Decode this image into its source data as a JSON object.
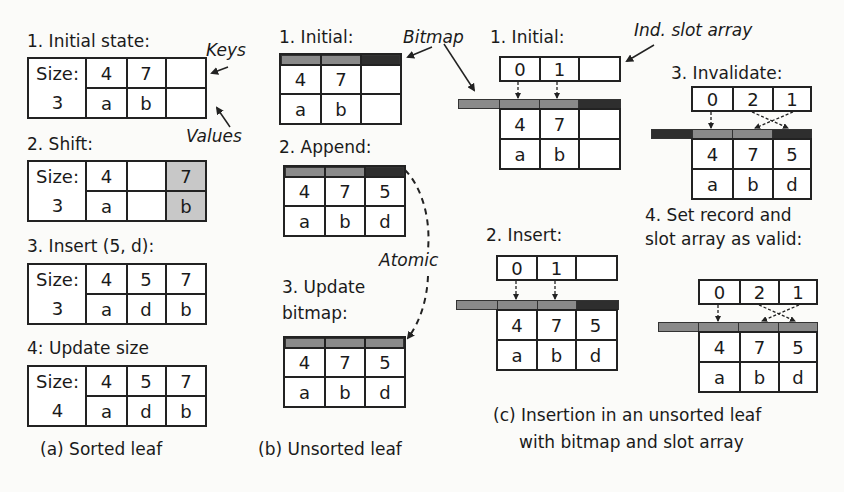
{
  "colors": {
    "border": "#222222",
    "shaded_cell": "#c8c8c8",
    "bitmap_valid": "#8a8a8a",
    "bitmap_invalid": "#2e2e2e",
    "background": "#fbfbf9"
  },
  "panel_a": {
    "caption": "(a) Sorted leaf",
    "annotations": {
      "keys": "Keys",
      "values": "Values"
    },
    "steps": [
      {
        "title": "1. Initial state:",
        "size_label": "Size:",
        "size_value": "3",
        "keys": [
          "4",
          "7",
          ""
        ],
        "values": [
          "a",
          "b",
          ""
        ],
        "shaded_col": null
      },
      {
        "title": "2. Shift:",
        "size_label": "Size:",
        "size_value": "3",
        "keys": [
          "4",
          "",
          "7"
        ],
        "values": [
          "a",
          "",
          "b"
        ],
        "shaded_col": 2
      },
      {
        "title": "3. Insert (5, d):",
        "size_label": "Size:",
        "size_value": "3",
        "keys": [
          "4",
          "5",
          "7"
        ],
        "values": [
          "a",
          "d",
          "b"
        ],
        "shaded_col": null
      },
      {
        "title": "4: Update size",
        "size_label": "Size:",
        "size_value": "4",
        "keys": [
          "4",
          "5",
          "7"
        ],
        "values": [
          "a",
          "d",
          "b"
        ],
        "shaded_col": null
      }
    ]
  },
  "panel_b": {
    "caption": "(b) Unsorted leaf",
    "annotations": {
      "bitmap": "Bitmap",
      "atomic": "Atomic"
    },
    "steps": [
      {
        "title": "1. Initial:",
        "bitmap": [
          "valid",
          "valid",
          "invalid"
        ],
        "keys": [
          "4",
          "7",
          ""
        ],
        "values": [
          "a",
          "b",
          ""
        ]
      },
      {
        "title": "2. Append:",
        "bitmap": [
          "valid",
          "valid",
          "invalid"
        ],
        "keys": [
          "4",
          "7",
          "5"
        ],
        "values": [
          "a",
          "b",
          "d"
        ]
      },
      {
        "title_line1": "3. Update",
        "title_line2": "bitmap:",
        "bitmap": [
          "valid",
          "valid",
          "valid"
        ],
        "keys": [
          "4",
          "7",
          "5"
        ],
        "values": [
          "a",
          "b",
          "d"
        ]
      }
    ]
  },
  "panel_c": {
    "caption_line1": "(c) Insertion in an unsorted leaf",
    "caption_line2": "with bitmap and slot array",
    "annotations": {
      "slot_array": "Ind. slot array"
    },
    "steps": [
      {
        "title": "1. Initial:",
        "slots": [
          "0",
          "1",
          ""
        ],
        "bitmap": [
          "valid",
          "valid",
          "valid",
          "invalid"
        ],
        "keys": [
          "4",
          "7",
          ""
        ],
        "values": [
          "a",
          "b",
          ""
        ]
      },
      {
        "title": "2. Insert:",
        "slots": [
          "0",
          "1",
          ""
        ],
        "bitmap": [
          "valid",
          "valid",
          "valid",
          "invalid"
        ],
        "keys": [
          "4",
          "7",
          "5"
        ],
        "values": [
          "a",
          "b",
          "d"
        ]
      },
      {
        "title": "3. Invalidate:",
        "slots": [
          "0",
          "2",
          "1"
        ],
        "bitmap": [
          "invalid",
          "valid",
          "valid",
          "invalid"
        ],
        "keys": [
          "4",
          "7",
          "5"
        ],
        "values": [
          "a",
          "b",
          "d"
        ]
      },
      {
        "title_line1": "4. Set record and",
        "title_line2": "slot array as valid:",
        "slots": [
          "0",
          "2",
          "1"
        ],
        "bitmap": [
          "valid",
          "valid",
          "valid",
          "valid"
        ],
        "keys": [
          "4",
          "7",
          "5"
        ],
        "values": [
          "a",
          "b",
          "d"
        ]
      }
    ]
  }
}
